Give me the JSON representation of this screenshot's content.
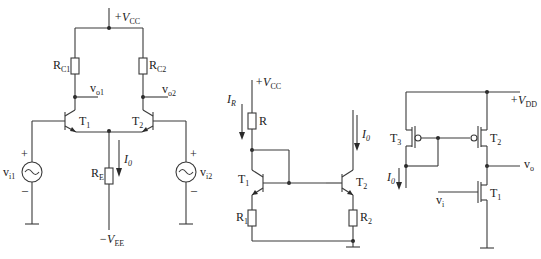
{
  "diagram": {
    "type": "circuit-schematics",
    "circuits": [
      {
        "name": "differential-amplifier",
        "labels": {
          "vcc": {
            "main": "+V",
            "sub": "CC"
          },
          "rc1": {
            "main": "R",
            "sub": "C1"
          },
          "rc2": {
            "main": "R",
            "sub": "C2"
          },
          "vo1": {
            "main": "v",
            "sub": "o1"
          },
          "vo2": {
            "main": "v",
            "sub": "o2"
          },
          "t1": {
            "main": "T",
            "sub": "1"
          },
          "t2": {
            "main": "T",
            "sub": "2"
          },
          "i0": {
            "main": "I",
            "sub": "0"
          },
          "re": {
            "main": "R",
            "sub": "E"
          },
          "vi1": {
            "main": "v",
            "sub": "i1"
          },
          "vi2": {
            "main": "v",
            "sub": "i2"
          },
          "vee": {
            "main": "−V",
            "sub": "EE"
          },
          "plus": "+",
          "minus": "–",
          "tilde": "~"
        }
      },
      {
        "name": "bjt-current-mirror",
        "labels": {
          "vcc": {
            "main": "+V",
            "sub": "CC"
          },
          "ir": {
            "main": "I",
            "sub": "R"
          },
          "r": {
            "main": "R",
            "sub": ""
          },
          "i0": {
            "main": "I",
            "sub": "0"
          },
          "t1": {
            "main": "T",
            "sub": "1"
          },
          "t2": {
            "main": "T",
            "sub": "2"
          },
          "r1": {
            "main": "R",
            "sub": "1"
          },
          "r2": {
            "main": "R",
            "sub": "2"
          }
        }
      },
      {
        "name": "mos-active-load-amplifier",
        "labels": {
          "vdd": {
            "main": "+V",
            "sub": "DD"
          },
          "t3": {
            "main": "T",
            "sub": "3"
          },
          "t2": {
            "main": "T",
            "sub": "2"
          },
          "t1": {
            "main": "T",
            "sub": "1"
          },
          "vo": {
            "main": "v",
            "sub": "o"
          },
          "vi": {
            "main": "v",
            "sub": "i"
          },
          "i0": {
            "main": "I",
            "sub": "0"
          }
        }
      }
    ]
  }
}
